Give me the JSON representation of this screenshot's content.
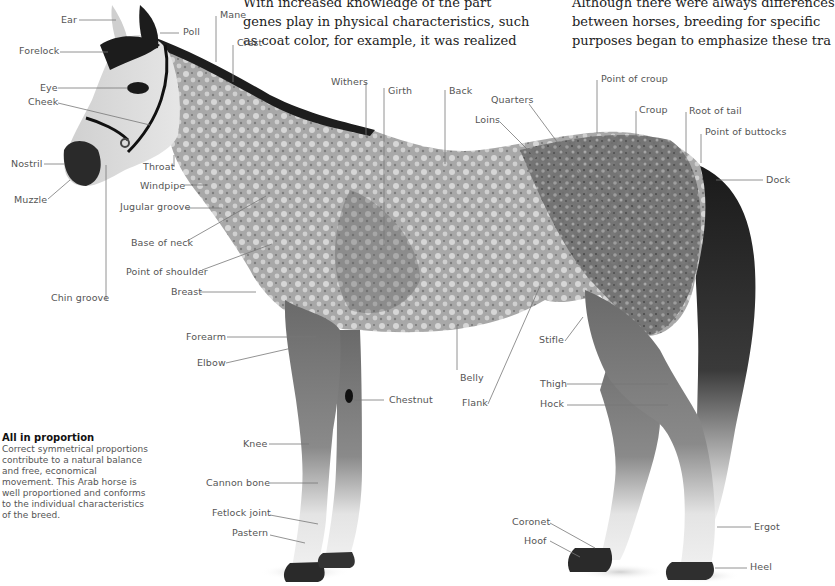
{
  "body_text": {
    "col1": [
      "With increased knowledge of the part",
      "genes play in physical characteristics, such",
      "as coat color, for example, it was realized"
    ],
    "col2": [
      "Although there were always differences",
      "between horses, breeding for specific",
      "purposes began to emphasize these tra"
    ]
  },
  "caption": {
    "title": "All in proportion",
    "lines": [
      "Correct symmetrical proportions",
      "contribute to a natural balance",
      "and free, economical",
      "movement. This Arab horse is",
      "well proportioned and conforms",
      "to the individual characteristics",
      "of the breed."
    ]
  },
  "labels": {
    "ear": "Ear",
    "poll": "Poll",
    "mane": "Mane",
    "crest": "Crest",
    "forelock": "Forelock",
    "eye": "Eye",
    "cheek": "Cheek",
    "nostril": "Nostril",
    "muzzle": "Muzzle",
    "throat": "Throat",
    "windpipe": "Windpipe",
    "jugular_groove": "Jugular groove",
    "base_of_neck": "Base of neck",
    "point_of_shoulder": "Point of shoulder",
    "breast": "Breast",
    "chin_groove": "Chin groove",
    "withers": "Withers",
    "girth": "Girth",
    "back": "Back",
    "quarters": "Quarters",
    "loins": "Loins",
    "point_of_croup": "Point of croup",
    "croup": "Croup",
    "root_of_tail": "Root of tail",
    "point_of_buttocks": "Point of buttocks",
    "dock": "Dock",
    "forearm": "Forearm",
    "elbow": "Elbow",
    "chestnut": "Chestnut",
    "belly": "Belly",
    "flank": "Flank",
    "stifle": "Stifle",
    "thigh": "Thigh",
    "hock": "Hock",
    "knee": "Knee",
    "cannon_bone": "Cannon bone",
    "fetlock_joint": "Fetlock joint",
    "pastern": "Pastern",
    "coronet": "Coronet",
    "hoof": "Hoof",
    "ergot": "Ergot",
    "heel": "Heel"
  },
  "colors": {
    "coat_light": "#d9d9d9",
    "coat_mid": "#9a9a9a",
    "coat_dark": "#4a4a4a",
    "mane_tail": "#1e1e1e",
    "leader_line": "#777777",
    "label_text": "#555555"
  }
}
